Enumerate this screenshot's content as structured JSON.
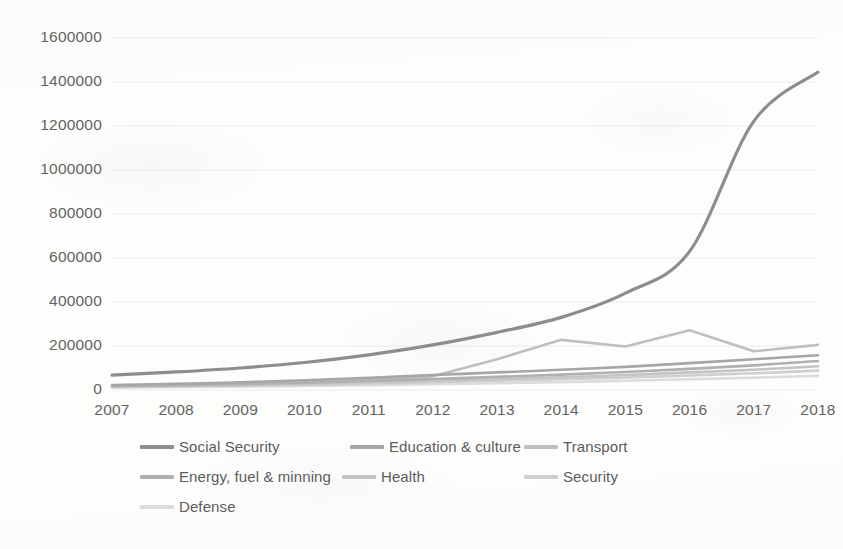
{
  "chart_data": {
    "type": "line",
    "title": "",
    "xlabel": "",
    "ylabel": "",
    "categories": [
      "2007",
      "2008",
      "2009",
      "2010",
      "2011",
      "2012",
      "2013",
      "2014",
      "2015",
      "2016",
      "2017",
      "2018"
    ],
    "x": [
      2007,
      2008,
      2009,
      2010,
      2011,
      2012,
      2013,
      2014,
      2015,
      2016,
      2017,
      2018
    ],
    "ylim": [
      0,
      1600000
    ],
    "ytick_values": [
      0,
      200000,
      400000,
      600000,
      800000,
      1000000,
      1200000,
      1400000,
      1600000
    ],
    "ytick_labels": [
      "0",
      "200000",
      "400000",
      "600000",
      "800000",
      "1000000",
      "1200000",
      "1400000",
      "1600000"
    ],
    "grid": true,
    "grid_axis": "y",
    "legend_position": "bottom",
    "series": [
      {
        "name": "Social Security",
        "color": "#8d8d8d",
        "values": [
          68000,
          82000,
          100000,
          125000,
          160000,
          205000,
          262000,
          330000,
          440000,
          630000,
          900000,
          1200000
        ]
      },
      {
        "name": "Education & culture",
        "color": "#a6a6a6",
        "values": [
          22000,
          28000,
          35000,
          44000,
          55000,
          68000,
          80000,
          92000,
          105000,
          122000,
          140000,
          158000
        ]
      },
      {
        "name": "Transport",
        "color": "#bfbfbf",
        "values": [
          19000,
          24000,
          30000,
          38000,
          48000,
          62000,
          140000,
          228000,
          198000,
          272000,
          176000,
          205000
        ]
      },
      {
        "name": "Energy, fuel & minning",
        "color": "#b0b0b0",
        "values": [
          18000,
          22000,
          27000,
          33000,
          41000,
          50000,
          60000,
          70000,
          82000,
          96000,
          112000,
          132000
        ]
      },
      {
        "name": "Health",
        "color": "#c4c4c4",
        "values": [
          16000,
          19000,
          23000,
          28000,
          34000,
          42000,
          50000,
          58000,
          68000,
          80000,
          92000,
          108000
        ]
      },
      {
        "name": "Security",
        "color": "#cfcfcf",
        "values": [
          14000,
          17000,
          20000,
          24000,
          29000,
          35000,
          42000,
          49000,
          57000,
          66000,
          76000,
          88000
        ]
      },
      {
        "name": "Defense",
        "color": "#dcdcdc",
        "values": [
          11000,
          13000,
          15000,
          18000,
          22000,
          26000,
          31000,
          36000,
          42000,
          49000,
          56000,
          64000
        ]
      }
    ],
    "series_corrections": {
      "social_security_2018": 1445000,
      "social_security_2017": 1222000
    }
  },
  "legend": {
    "rows": [
      [
        {
          "label": "Social Security",
          "color": "#8d8d8d",
          "left": 28
        },
        {
          "label": "Education & culture",
          "color": "#a6a6a6",
          "left": 238
        },
        {
          "label": "Transport",
          "color": "#bfbfbf",
          "left": 412
        }
      ],
      [
        {
          "label": "Energy, fuel & minning",
          "color": "#b0b0b0",
          "left": 28
        },
        {
          "label": "Health",
          "color": "#c4c4c4",
          "left": 230
        },
        {
          "label": "Security",
          "color": "#cfcfcf",
          "left": 412
        }
      ],
      [
        {
          "label": "Defense",
          "color": "#dcdcdc",
          "left": 28
        }
      ]
    ]
  },
  "colors": {
    "background": "#fdfdfc",
    "gridline": "#ececec",
    "axis_text": "#636363",
    "legend_text": "#5c5c5c"
  }
}
